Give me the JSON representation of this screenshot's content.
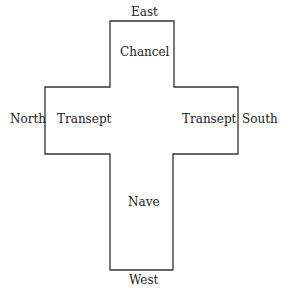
{
  "diagram": {
    "compass": {
      "east": "East",
      "west": "West",
      "north": "North",
      "south": "South"
    },
    "areas": {
      "chancel": "Chancel",
      "north_transept": "Transept",
      "south_transept": "Transept",
      "nave": "Nave"
    },
    "outline": {
      "stroke_color": "#333333",
      "points": [
        [
          110,
          21
        ],
        [
          174,
          21
        ],
        [
          174,
          87
        ],
        [
          238,
          87
        ],
        [
          238,
          154
        ],
        [
          173,
          154
        ],
        [
          173,
          270
        ],
        [
          110,
          270
        ],
        [
          110,
          154
        ],
        [
          45,
          154
        ],
        [
          45,
          87
        ],
        [
          110,
          87
        ]
      ]
    }
  }
}
